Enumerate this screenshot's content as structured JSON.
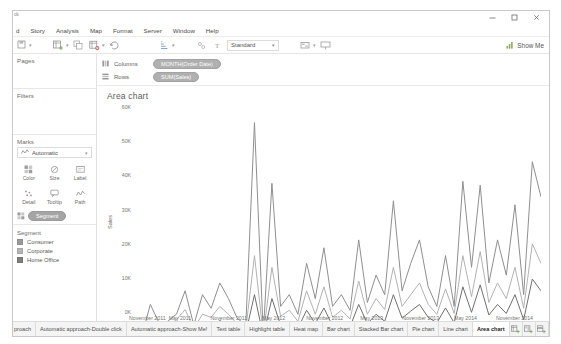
{
  "window": {
    "clipped_title": "ck",
    "controls": [
      {
        "name": "minimize",
        "glyph": "minimize-icon"
      },
      {
        "name": "maximize",
        "glyph": "maximize-icon"
      },
      {
        "name": "close",
        "glyph": "close-icon"
      }
    ]
  },
  "menubar": {
    "items": [
      {
        "label": "d"
      },
      {
        "label": "Story"
      },
      {
        "label": "Analysis"
      },
      {
        "label": "Map"
      },
      {
        "label": "Format"
      },
      {
        "label": "Server"
      },
      {
        "label": "Window"
      },
      {
        "label": "Help"
      }
    ]
  },
  "toolbar": {
    "items": [
      {
        "name": "save-icon",
        "has_caret": true
      },
      {
        "name": "undo-icon",
        "has_caret": false
      },
      {
        "name": "redo-icon",
        "has_caret": false
      },
      {
        "name": "new-worksheet-icon",
        "has_caret": true
      },
      {
        "name": "duplicate-sheet-icon",
        "has_caret": false
      },
      {
        "name": "clear-sheet-icon",
        "has_caret": true
      },
      {
        "name": "refresh-data-icon",
        "has_caret": false
      },
      {
        "name": "swap-rows-columns-icon",
        "has_caret": false
      },
      {
        "name": "sort-ascending-icon",
        "has_caret": true
      },
      {
        "name": "sort-descending-icon",
        "has_caret": false
      },
      {
        "name": "group-members-icon",
        "has_caret": false
      },
      {
        "name": "show-mark-labels-icon",
        "has_caret": false
      }
    ],
    "fit_select": {
      "value": "Standard",
      "caret": "chevron-down-icon"
    },
    "highlight": {
      "name": "highlight-icon",
      "has_caret": true
    },
    "presentation": {
      "name": "presentation-mode-icon"
    },
    "show_me": {
      "label": "Show Me",
      "icon": "show-me-icon"
    }
  },
  "left_panel": {
    "pages": {
      "title": "Pages"
    },
    "filters": {
      "title": "Filters"
    },
    "marks": {
      "title": "Marks",
      "mark_type": {
        "value": "Automatic",
        "icon": "line-mark-icon",
        "caret": "chevron-down-icon"
      },
      "buttons": [
        {
          "label": "Color",
          "icon": "color-icon"
        },
        {
          "label": "Size",
          "icon": "size-icon"
        },
        {
          "label": "Label",
          "icon": "label-icon"
        },
        {
          "label": "Detail",
          "icon": "detail-icon"
        },
        {
          "label": "Tooltip",
          "icon": "tooltip-icon"
        },
        {
          "label": "Path",
          "icon": "path-icon"
        }
      ],
      "encoded_field": {
        "label": "Segment",
        "icon": "color-icon"
      }
    },
    "legend": {
      "title": "Segment",
      "entries": [
        {
          "label": "Consumer",
          "color": "#9a9a9a"
        },
        {
          "label": "Corporate",
          "color": "#b5b5b5"
        },
        {
          "label": "Home Office",
          "color": "#7e7e7e"
        }
      ]
    }
  },
  "shelves": {
    "columns": {
      "name": "Columns",
      "icon": "columns-icon",
      "pill": "MONTH(Order Date)"
    },
    "rows": {
      "name": "Rows",
      "icon": "rows-icon",
      "pill": "SUM(Sales)"
    }
  },
  "sheet": {
    "title": "Area chart"
  },
  "chart_data": {
    "type": "line",
    "title": "Area chart",
    "xlabel": "Month of Order Date",
    "ylabel": "Sales",
    "ylim": [
      0,
      60000
    ],
    "yticks": [
      0,
      10000,
      20000,
      30000,
      40000,
      50000,
      60000
    ],
    "ytick_labels": [
      "0K",
      "10K",
      "20K",
      "30K",
      "40K",
      "50K",
      "60K"
    ],
    "grid": false,
    "legend_position": "right-panel",
    "xtick_labels": [
      "November 2011",
      "May 2011",
      "November 2011",
      "May 2012",
      "November 2012",
      "May 2013",
      "November 2013",
      "May 2014",
      "November 2014"
    ],
    "xtick_positions": [
      0.035,
      0.115,
      0.235,
      0.345,
      0.47,
      0.585,
      0.705,
      0.815,
      0.935
    ],
    "x": [
      0,
      1,
      2,
      3,
      4,
      5,
      6,
      7,
      8,
      9,
      10,
      11,
      12,
      13,
      14,
      15,
      16,
      17,
      18,
      19,
      20,
      21,
      22,
      23,
      24,
      25,
      26,
      27,
      28,
      29,
      30,
      31,
      32,
      33,
      34,
      35,
      36,
      37,
      38,
      39,
      40,
      41,
      42,
      43,
      44,
      45,
      46,
      47
    ],
    "series": [
      {
        "name": "Consumer",
        "color": "#8f8f8f",
        "values": [
          3500,
          1200,
          9500,
          4800,
          5200,
          7000,
          13000,
          4200,
          12000,
          8500,
          15000,
          11000,
          6000,
          4200,
          56000,
          2000,
          40500,
          9000,
          12000,
          7000,
          20000,
          11000,
          24000,
          9000,
          12000,
          8000,
          26000,
          10000,
          17000,
          12000,
          36000,
          13000,
          20000,
          26000,
          14000,
          9000,
          22000,
          9000,
          41000,
          19000,
          40000,
          15000,
          26000,
          17000,
          35000,
          12000,
          46000,
          37000
        ]
      },
      {
        "name": "Corporate",
        "color": "#b2b2b2",
        "values": [
          2000,
          1000,
          5200,
          3600,
          4000,
          5600,
          8200,
          3400,
          7000,
          6200,
          9000,
          7000,
          4500,
          3200,
          22000,
          1800,
          19000,
          6500,
          8000,
          5200,
          13000,
          7000,
          14000,
          6200,
          8000,
          5800,
          15500,
          7000,
          11000,
          8200,
          19000,
          9000,
          12000,
          15000,
          9500,
          7000,
          13500,
          7200,
          22000,
          11500,
          23000,
          10000,
          15000,
          11000,
          19000,
          8500,
          25000,
          20000
        ]
      },
      {
        "name": "Home Office",
        "color": "#6f6f6f",
        "values": [
          1500,
          800,
          3000,
          2400,
          2800,
          3200,
          5000,
          2200,
          4200,
          3800,
          5400,
          4200,
          3000,
          2200,
          12000,
          1400,
          11000,
          4200,
          5000,
          3400,
          8000,
          4600,
          8600,
          4000,
          5000,
          3800,
          9500,
          4600,
          7000,
          5200,
          12000,
          6000,
          7800,
          9500,
          6200,
          4800,
          8600,
          4800,
          14000,
          7500,
          14500,
          6800,
          9500,
          7200,
          12000,
          5600,
          16000,
          13000
        ]
      }
    ]
  },
  "tabbar": {
    "tabs": [
      {
        "label": "proach",
        "active": false,
        "clipped": true
      },
      {
        "label": "Automatic approach-Double click",
        "active": false
      },
      {
        "label": "Automatic approach-Show Me!",
        "active": false
      },
      {
        "label": "Text table",
        "active": false
      },
      {
        "label": "Highlight table",
        "active": false
      },
      {
        "label": "Heat map",
        "active": false
      },
      {
        "label": "Bar chart",
        "active": false
      },
      {
        "label": "Stacked Bar chart",
        "active": false
      },
      {
        "label": "Pie chart",
        "active": false
      },
      {
        "label": "Line chart",
        "active": false
      },
      {
        "label": "Area chart",
        "active": true
      }
    ],
    "icons": [
      {
        "name": "new-worksheet-tab-icon"
      },
      {
        "name": "new-dashboard-tab-icon"
      },
      {
        "name": "new-story-tab-icon"
      }
    ]
  }
}
